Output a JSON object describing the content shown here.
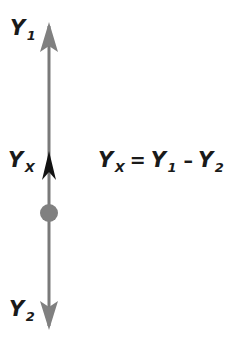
{
  "figure": {
    "background_color": "#ffffff",
    "axis": {
      "line_color": "#7a7a7a",
      "line_width": 3,
      "x": 49,
      "top_y": 22,
      "bottom_y": 330
    },
    "markers": {
      "arrow_up_top": {
        "name": "arrowhead-up-top",
        "color": "#808080",
        "tip_y": 22,
        "base_y": 52,
        "half_width": 9
      },
      "arrow_up_middle": {
        "name": "arrowhead-up-middle",
        "color": "#121212",
        "tip_y": 151,
        "base_y": 180,
        "half_width": 7
      },
      "dot": {
        "name": "node-dot",
        "color": "#808080",
        "center_y": 213,
        "radius": 9
      },
      "arrow_down_bottom": {
        "name": "arrowhead-down-bottom",
        "color": "#808080",
        "tip_y": 330,
        "base_y": 301,
        "half_width": 9
      }
    }
  },
  "labels": {
    "y1": {
      "base": "Y",
      "sub": "1"
    },
    "yx_axis": {
      "base": "Y",
      "sub": "X"
    },
    "y2": {
      "base": "Y",
      "sub": "2"
    }
  },
  "equation": {
    "lhs_base": "Y",
    "lhs_sub": "X",
    "equals": "=",
    "term1_base": "Y",
    "term1_sub": "1",
    "minus": "–",
    "term2_base": "Y",
    "term2_sub": "2",
    "plain_text": "Y_X = Y_1 – Y_2"
  }
}
